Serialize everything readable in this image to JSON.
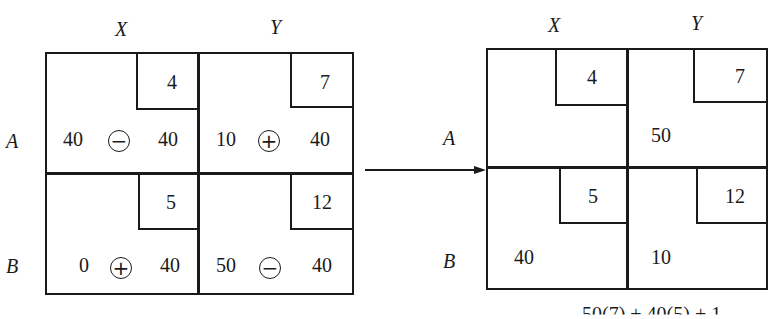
{
  "left_table": {
    "col_labels": [
      "X",
      "Y"
    ],
    "row_labels": [
      "A",
      "B"
    ],
    "cells": [
      {
        "row": "A",
        "col": "X",
        "cost": "4",
        "left": "40",
        "sign": "−",
        "right": "40"
      },
      {
        "row": "A",
        "col": "Y",
        "cost": "7",
        "left": "10",
        "sign": "+",
        "right": "40"
      },
      {
        "row": "B",
        "col": "X",
        "cost": "5",
        "left": "0",
        "sign": "+",
        "right": "40"
      },
      {
        "row": "B",
        "col": "Y",
        "cost": "12",
        "left": "50",
        "sign": "−",
        "right": "40"
      }
    ]
  },
  "right_table": {
    "col_labels": [
      "X",
      "Y"
    ],
    "row_labels": [
      "A",
      "B"
    ],
    "cells": [
      {
        "row": "A",
        "col": "X",
        "cost": "4",
        "value": ""
      },
      {
        "row": "A",
        "col": "Y",
        "cost": "7",
        "value": "50"
      },
      {
        "row": "B",
        "col": "X",
        "cost": "5",
        "value": "40"
      },
      {
        "row": "B",
        "col": "Y",
        "cost": "12",
        "value": "10"
      }
    ]
  },
  "arrow": {
    "direction": "right"
  },
  "footer_text_partial": "50(7) + 40(5) + 1"
}
